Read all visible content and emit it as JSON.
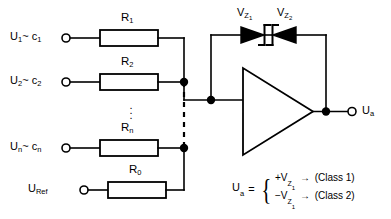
{
  "figure": {
    "background_color": "#ffffff",
    "line_color": "#000000"
  },
  "inputs": [
    {
      "id": "in1",
      "label_u": "U",
      "label_u_sub": "1",
      "tilde": "~",
      "label_c": "c",
      "label_c_sub": "1",
      "text": "U₁~ c₁",
      "resistor": "R₁",
      "resistor_base": "R",
      "resistor_sub": "1"
    },
    {
      "id": "in2",
      "label_u": "U",
      "label_u_sub": "2",
      "tilde": "~",
      "label_c": "c",
      "label_c_sub": "2",
      "text": "U₂~ c₂",
      "resistor": "R₂",
      "resistor_base": "R",
      "resistor_sub": "2"
    },
    {
      "id": "inn",
      "label_u": "U",
      "label_u_sub": "n",
      "tilde": "~",
      "label_c": "c",
      "label_c_sub": "n",
      "text": "Uₙ~ cₙ",
      "resistor": "Rₙ",
      "resistor_base": "R",
      "resistor_sub": "n"
    },
    {
      "id": "inref",
      "label_u": "U",
      "label_u_sub": "Ref",
      "tilde": "",
      "label_c": "",
      "label_c_sub": "",
      "text": "U_Ref",
      "resistor": "R₀",
      "resistor_base": "R",
      "resistor_sub": "0"
    }
  ],
  "labels": {
    "u1": "U",
    "u1_sub": "1",
    "c1": "c",
    "c1_sub": "1",
    "u2": "U",
    "u2_sub": "2",
    "c2": "c",
    "c2_sub": "2",
    "un": "U",
    "un_sub": "n",
    "cn": "c",
    "cn_sub": "n",
    "uref": "U",
    "uref_sub": "Ref",
    "tilde": "~",
    "r1": "R",
    "r1_sub": "1",
    "r2": "R",
    "r2_sub": "2",
    "rn": "R",
    "rn_sub": "n",
    "r0": "R",
    "r0_sub": "0",
    "vz1": "V",
    "vz1_sub": "Z",
    "vz1_sub2": "1",
    "vz2": "V",
    "vz2_sub": "Z",
    "vz2_sub2": "2",
    "ua_out": "U",
    "ua_out_sub": "a",
    "vertical_ellipsis": "⋮"
  },
  "equation": {
    "lhs": "U",
    "lhs_sub": "a",
    "equals": "=",
    "brace": "{",
    "line1_value": "+V",
    "line1_sub": "Z",
    "line1_sub2": "1",
    "line1_arrow": "→",
    "line1_result": "(Class 1)",
    "line2_value": "−V",
    "line2_sub": "Z",
    "line2_sub2": "1",
    "line2_arrow": "→",
    "line2_result": "(Class 2)",
    "full_text": "U_a = { +V_Z1 → (Class 1) ; −V_Z1 → (Class 2) }"
  },
  "components": {
    "opamp_name": "operational-amplifier",
    "diode1_name": "zener-diode-vz1",
    "diode2_name": "zener-diode-vz2",
    "junction_count": 5,
    "terminal_count": 5,
    "dashed_line": "continuation between R2 node and Rn node"
  }
}
